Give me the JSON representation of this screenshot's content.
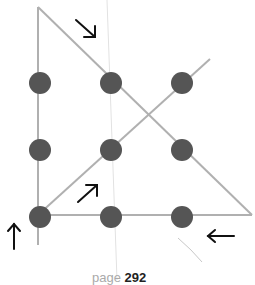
{
  "diagram": {
    "dot_color": "#555555",
    "line_color": "#b0b0b0",
    "arrow_color": "#111111",
    "dots": [
      {
        "row": 0,
        "col": 0
      },
      {
        "row": 0,
        "col": 1
      },
      {
        "row": 0,
        "col": 2
      },
      {
        "row": 1,
        "col": 0
      },
      {
        "row": 1,
        "col": 1
      },
      {
        "row": 1,
        "col": 2
      },
      {
        "row": 2,
        "col": 0
      },
      {
        "row": 2,
        "col": 1
      },
      {
        "row": 2,
        "col": 2
      }
    ],
    "arrows": [
      {
        "direction": "down-right",
        "glyph": "↘"
      },
      {
        "direction": "up-right",
        "glyph": "↗"
      },
      {
        "direction": "up",
        "glyph": "↑"
      },
      {
        "direction": "left",
        "glyph": "←"
      }
    ]
  },
  "caption": {
    "faint": "page ",
    "bold": "292"
  }
}
